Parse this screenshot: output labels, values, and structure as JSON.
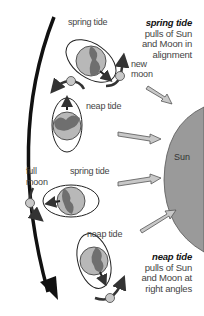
{
  "diagram": {
    "captions": {
      "spring": {
        "title": "spring tide",
        "line1": "pulls of Sun",
        "line2": "and Moon in",
        "line3": "alignment"
      },
      "neap": {
        "title": "neap tide",
        "line1": "pulls of Sun",
        "line2": "and Moon at",
        "line3": "right angles"
      }
    },
    "labels": {
      "spring_top": "spring tide",
      "neap_upper": "neap tide",
      "spring_lower": "spring tide",
      "neap_bottom": "neap tide",
      "new_moon_1": "new",
      "new_moon_2": "moon",
      "full_moon_1": "full",
      "full_moon_2": "moon",
      "sun": "Sun"
    },
    "colors": {
      "earth_land": "#7a7a7a",
      "earth_ocean": "#b8b8b8",
      "moon": "#c8c8c8",
      "sun": "#9a9a9a",
      "arrow_dark": "#333333",
      "sunray_fill": "#c0c0c0"
    }
  }
}
